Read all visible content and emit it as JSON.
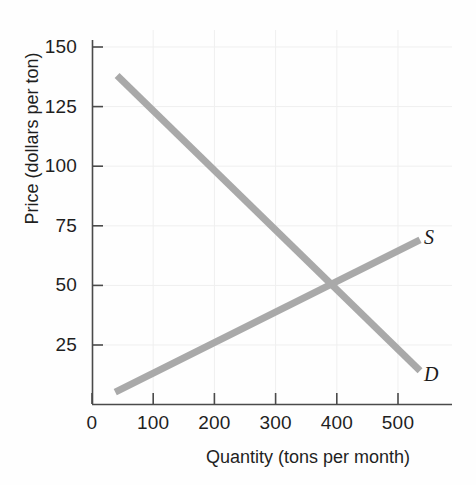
{
  "chart_data": {
    "type": "line",
    "title": "",
    "xlabel": "Quantity (tons per month)",
    "ylabel": "Price (dollars per ton)",
    "xlim": [
      0,
      560
    ],
    "ylim": [
      0,
      160
    ],
    "xticks": [
      0,
      100,
      200,
      300,
      400,
      500
    ],
    "yticks": [
      25,
      50,
      75,
      100,
      125,
      150
    ],
    "xtick_labels": [
      "0",
      "100",
      "200",
      "300",
      "400",
      "500"
    ],
    "ytick_labels": [
      "25",
      "50",
      "75",
      "100",
      "125",
      "150"
    ],
    "grid": true,
    "legend_position": "inline-right-end",
    "line_color": "#a9a9a9",
    "grid_color": "#ededed",
    "axis_color": "#555555",
    "series": [
      {
        "name": "S",
        "label": "S",
        "description": "Supply curve, upward sloping",
        "points": [
          {
            "x": 38,
            "y": 5
          },
          {
            "x": 400,
            "y": 50
          },
          {
            "x": 536,
            "y": 69
          }
        ]
      },
      {
        "name": "D",
        "label": "D",
        "description": "Demand curve, downward sloping",
        "points": [
          {
            "x": 41,
            "y": 138
          },
          {
            "x": 400,
            "y": 50
          },
          {
            "x": 536,
            "y": 14
          }
        ]
      }
    ],
    "equilibrium": {
      "x": 400,
      "y": 50,
      "label": ""
    }
  },
  "ticks": {
    "y": [
      {
        "label": "150",
        "value": 150
      },
      {
        "label": "125",
        "value": 125
      },
      {
        "label": "100",
        "value": 100
      },
      {
        "label": "75",
        "value": 75
      },
      {
        "label": "50",
        "value": 50
      },
      {
        "label": "25",
        "value": 25
      }
    ],
    "x": [
      {
        "label": "0",
        "value": 0
      },
      {
        "label": "100",
        "value": 100
      },
      {
        "label": "200",
        "value": 200
      },
      {
        "label": "300",
        "value": 300
      },
      {
        "label": "400",
        "value": 400
      },
      {
        "label": "500",
        "value": 500
      }
    ]
  },
  "axis_titles": {
    "y": "Price (dollars per ton)",
    "x": "Quantity (tons per month)"
  },
  "curve_labels": {
    "supply": "S",
    "demand": "D"
  }
}
